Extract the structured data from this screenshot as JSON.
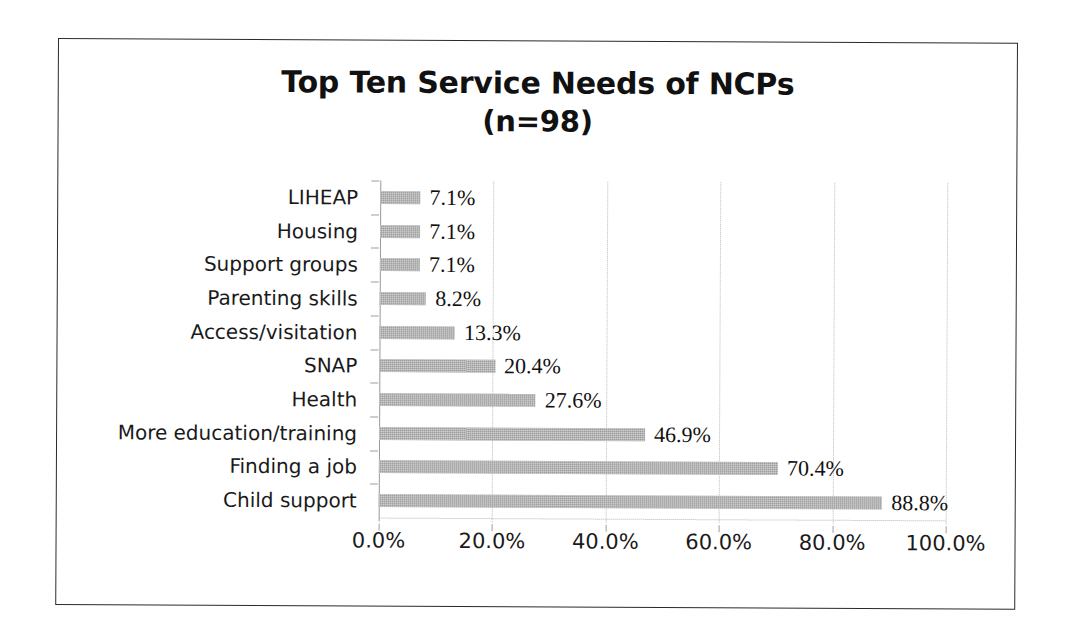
{
  "chart_data": {
    "type": "bar",
    "orientation": "horizontal",
    "title": "Top Ten Service Needs of NCPs",
    "subtitle": "(n=98)",
    "xlabel": "",
    "ylabel": "",
    "xlim": [
      0,
      100
    ],
    "grid": true,
    "legend": false,
    "categories": [
      "LIHEAP",
      "Housing",
      "Support groups",
      "Parenting skills",
      "Access/visitation",
      "SNAP",
      "Health",
      "More education/training",
      "Finding a job",
      "Child support"
    ],
    "values": [
      7.1,
      7.1,
      7.1,
      8.2,
      13.3,
      20.4,
      27.6,
      46.9,
      70.4,
      88.8
    ],
    "data_labels": [
      "7.1%",
      "7.1%",
      "7.1%",
      "8.2%",
      "13.3%",
      "20.4%",
      "27.6%",
      "46.9%",
      "70.4%",
      "88.8%"
    ],
    "x_tick_values": [
      0,
      20,
      40,
      60,
      80,
      100
    ],
    "x_tick_labels": [
      "0.0%",
      "20.0%",
      "40.0%",
      "60.0%",
      "80.0%",
      "100.0%"
    ],
    "bar_color": "#9c9c9c",
    "grid_color": "#b9b9b9",
    "frame_color": "#2b2b2b"
  }
}
